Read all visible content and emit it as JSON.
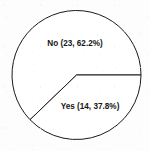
{
  "chart_data": {
    "type": "pie",
    "title": "",
    "subtitle": "",
    "xlabel": "",
    "ylabel": "",
    "grid": false,
    "legend_position": "none",
    "label_placement": "inside-slice",
    "total_count": 37,
    "start_angle_deg": 0,
    "direction": "clockwise",
    "categories": [
      "No",
      "Yes"
    ],
    "values": [
      23,
      14
    ],
    "percentages": [
      62.2,
      37.8
    ],
    "slices": [
      {
        "name": "No",
        "count": 23,
        "percent": 62.2,
        "label": "No (23, 62.2%)",
        "sweep_deg": 223.9,
        "start_deg": 136.1,
        "end_deg": 360.0,
        "fill": "#ffffff",
        "stroke": "#1a1a1a",
        "label_x": 75,
        "label_y": 44
      },
      {
        "name": "Yes",
        "count": 14,
        "percent": 37.8,
        "label": "Yes (14, 37.8%)",
        "sweep_deg": 136.1,
        "start_deg": 0.0,
        "end_deg": 136.1,
        "fill": "#ffffff",
        "stroke": "#1a1a1a",
        "label_x": 90,
        "label_y": 107
      }
    ],
    "geometry": {
      "center_x": 76.5,
      "center_y": 75,
      "radius": 64.5
    },
    "colors": {
      "background": "#fdfdfd",
      "outline": "#1a1a1a",
      "text": "#161616",
      "slice_fill": "#ffffff"
    }
  }
}
